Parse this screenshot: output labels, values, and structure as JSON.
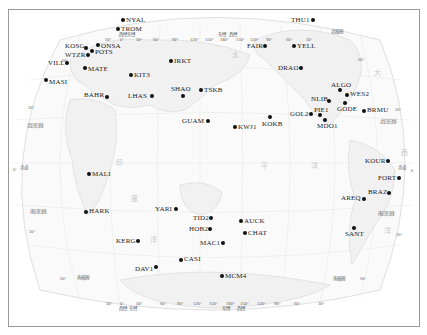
{
  "map": {
    "projection": "world map, Pacific-centered, with latitude/longitude graticule",
    "colors": {
      "frame": "#9a9a9a",
      "land": "#f3f3f3",
      "coast": "#d9d9d9",
      "grid": "#e2e2e2",
      "station_dot": "#111111",
      "label": "#1a1a1a"
    },
    "top_axis": {
      "ticks": [
        "30°",
        "西经",
        "0°",
        "东经",
        "30°",
        "60°",
        "90°",
        "120°",
        "150°",
        "东经",
        "180°",
        "西经",
        "150°",
        "120°",
        "90°",
        "60°",
        "30°"
      ]
    },
    "bottom_axis": {
      "ticks": [
        "30°",
        "西经",
        "0°",
        "东经",
        "30°",
        "60°",
        "90°",
        "120°",
        "150°",
        "东经",
        "180°",
        "西经",
        "150°",
        "120°",
        "90°",
        "60°",
        "30°"
      ]
    },
    "latitude_labels": {
      "left": [
        "60°",
        "30°",
        "北回归线",
        "0°",
        "赤道",
        "南回归线",
        "30°",
        "60°",
        "南极圈"
      ],
      "right": [
        "北极圈",
        "60°",
        "30°",
        "北回归线",
        "赤道",
        "0",
        "南回归线",
        "30°",
        "南极圈",
        "60°"
      ]
    },
    "ocean_labels": [
      "太",
      "平",
      "洋",
      "印",
      "度",
      "洋",
      "大",
      "西",
      "洋"
    ],
    "stations": [
      {
        "name": "NYAL",
        "x": 123,
        "y": 20,
        "label_side": "right"
      },
      {
        "name": "TROM",
        "x": 118,
        "y": 29,
        "label_side": "right"
      },
      {
        "name": "ONSA",
        "x": 98,
        "y": 45,
        "label_side": "right"
      },
      {
        "name": "KOSG",
        "x": 86,
        "y": 48,
        "label_side": "left"
      },
      {
        "name": "POTS",
        "x": 92,
        "y": 51,
        "label_side": "right"
      },
      {
        "name": "WTZR",
        "x": 88,
        "y": 55,
        "label_side": "left"
      },
      {
        "name": "VILL",
        "x": 67,
        "y": 63,
        "label_side": "left"
      },
      {
        "name": "MATE",
        "x": 85,
        "y": 68,
        "label_side": "right"
      },
      {
        "name": "IRKT",
        "x": 171,
        "y": 61,
        "label_side": "right"
      },
      {
        "name": "KIT3",
        "x": 131,
        "y": 75,
        "label_side": "right"
      },
      {
        "name": "MASI",
        "x": 46,
        "y": 80,
        "label_side": "right"
      },
      {
        "name": "BAHR",
        "x": 107,
        "y": 97,
        "label_side": "left"
      },
      {
        "name": "LHAS",
        "x": 152,
        "y": 96,
        "label_side": "left"
      },
      {
        "name": "SHAO",
        "x": 183,
        "y": 96,
        "label_side": "top"
      },
      {
        "name": "TSKB",
        "x": 201,
        "y": 90,
        "label_side": "right"
      },
      {
        "name": "GUAM",
        "x": 208,
        "y": 121,
        "label_side": "left"
      },
      {
        "name": "KWJ1",
        "x": 235,
        "y": 127,
        "label_side": "right"
      },
      {
        "name": "KOKB",
        "x": 270,
        "y": 117,
        "label_side": "bottom"
      },
      {
        "name": "MALI",
        "x": 89,
        "y": 174,
        "label_side": "right"
      },
      {
        "name": "HARK",
        "x": 86,
        "y": 212,
        "label_side": "right"
      },
      {
        "name": "YARI",
        "x": 176,
        "y": 209,
        "label_side": "left"
      },
      {
        "name": "TID2",
        "x": 211,
        "y": 218,
        "label_side": "left"
      },
      {
        "name": "HOB2",
        "x": 210,
        "y": 229,
        "label_side": "left"
      },
      {
        "name": "AUCK",
        "x": 241,
        "y": 221,
        "label_side": "right"
      },
      {
        "name": "CHAT",
        "x": 245,
        "y": 233,
        "label_side": "right"
      },
      {
        "name": "MAC1",
        "x": 223,
        "y": 243,
        "label_side": "left"
      },
      {
        "name": "KERG",
        "x": 138,
        "y": 241,
        "label_side": "left"
      },
      {
        "name": "CASI",
        "x": 181,
        "y": 260,
        "label_side": "right"
      },
      {
        "name": "DAV1",
        "x": 156,
        "y": 267,
        "label_side": "left"
      },
      {
        "name": "MCM4",
        "x": 222,
        "y": 276,
        "label_side": "right"
      },
      {
        "name": "THU1",
        "x": 313,
        "y": 20,
        "label_side": "left"
      },
      {
        "name": "FAIR",
        "x": 265,
        "y": 46,
        "label_side": "left"
      },
      {
        "name": "YELL",
        "x": 294,
        "y": 46,
        "label_side": "right"
      },
      {
        "name": "DRAO",
        "x": 301,
        "y": 68,
        "label_side": "left"
      },
      {
        "name": "ALGO",
        "x": 340,
        "y": 90,
        "label_side": "top"
      },
      {
        "name": "WES2",
        "x": 347,
        "y": 95,
        "label_side": "right"
      },
      {
        "name": "NLIB",
        "x": 329,
        "y": 101,
        "label_side": "left"
      },
      {
        "name": "GODE",
        "x": 345,
        "y": 103,
        "label_side": "bottom"
      },
      {
        "name": "BRMU",
        "x": 364,
        "y": 111,
        "label_side": "right"
      },
      {
        "name": "GOL2",
        "x": 311,
        "y": 114,
        "label_side": "left"
      },
      {
        "name": "PIE1",
        "x": 320,
        "y": 115,
        "label_side": "top"
      },
      {
        "name": "MDO1",
        "x": 325,
        "y": 120,
        "label_side": "bottom"
      },
      {
        "name": "KOUR",
        "x": 388,
        "y": 161,
        "label_side": "left"
      },
      {
        "name": "FORT",
        "x": 399,
        "y": 178,
        "label_side": "left"
      },
      {
        "name": "BRAZ",
        "x": 389,
        "y": 193,
        "label_side": "left"
      },
      {
        "name": "AREQ",
        "x": 364,
        "y": 199,
        "label_side": "left"
      },
      {
        "name": "SANT",
        "x": 354,
        "y": 228,
        "label_side": "bottom"
      }
    ]
  }
}
